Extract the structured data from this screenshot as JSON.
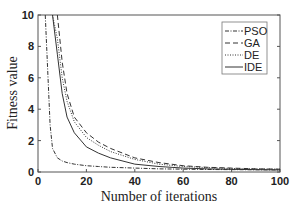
{
  "chart_data": {
    "type": "line",
    "title": "",
    "xlabel": "Number of iterations",
    "ylabel": "Fitness value",
    "xlim": [
      0,
      100
    ],
    "ylim": [
      0,
      10
    ],
    "xticks": [
      0,
      20,
      40,
      60,
      80,
      100
    ],
    "yticks": [
      0,
      2,
      4,
      6,
      8,
      10
    ],
    "grid": false,
    "legend_position": "upper right",
    "x": [
      3,
      5,
      6,
      8,
      10,
      12,
      15,
      20,
      25,
      30,
      40,
      50,
      60,
      70,
      80,
      90,
      100
    ],
    "series": [
      {
        "name": "PSO",
        "style": "dash-dot",
        "values": [
          10,
          3.0,
          1.5,
          0.9,
          0.7,
          0.6,
          0.5,
          0.4,
          0.35,
          0.3,
          0.25,
          0.2,
          0.18,
          0.16,
          0.15,
          0.14,
          0.13
        ]
      },
      {
        "name": "GA",
        "style": "dashed",
        "values": [
          null,
          null,
          null,
          10,
          7.0,
          5.0,
          3.5,
          2.5,
          1.9,
          1.5,
          0.9,
          0.6,
          0.4,
          0.3,
          0.25,
          0.2,
          0.18
        ]
      },
      {
        "name": "DE",
        "style": "dotted",
        "values": [
          null,
          null,
          10,
          8.5,
          6.0,
          4.5,
          3.2,
          2.2,
          1.7,
          1.3,
          0.8,
          0.5,
          0.35,
          0.28,
          0.22,
          0.2,
          0.18
        ]
      },
      {
        "name": "IDE",
        "style": "solid",
        "values": [
          null,
          null,
          10,
          7.5,
          5.0,
          3.5,
          2.5,
          1.6,
          1.2,
          0.9,
          0.5,
          0.35,
          0.25,
          0.2,
          0.17,
          0.15,
          0.13
        ]
      }
    ]
  }
}
